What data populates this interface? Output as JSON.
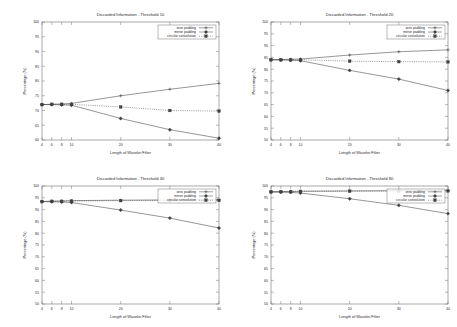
{
  "figure": {
    "layout": "2x2 grid of line charts",
    "shared": {
      "xlabel": "Length of Wavelet Filter",
      "ylabel": "Percentage (%)",
      "xticks": [
        4,
        6,
        8,
        10,
        20,
        30,
        40
      ],
      "xlim": [
        4,
        40
      ],
      "series_names": [
        "zero padding",
        "mirror padding",
        "circular convolution"
      ]
    }
  },
  "chart_data": [
    {
      "type": "line",
      "title": "Discarded Information - Threshold 10",
      "xlabel": "Length of Wavelet Filter",
      "ylabel": "Percentage (%)",
      "xlim": [
        4,
        40
      ],
      "ylim": [
        60,
        100
      ],
      "yticks": [
        60,
        65,
        70,
        75,
        80,
        85,
        90,
        95,
        100
      ],
      "xticks": [
        4,
        6,
        8,
        10,
        20,
        30,
        40
      ],
      "grid": false,
      "legend_position": "top-right",
      "x": [
        4,
        6,
        8,
        10,
        20,
        30,
        40
      ],
      "series": [
        {
          "name": "zero padding",
          "values": [
            72.0,
            72.1,
            72.2,
            72.4,
            75.0,
            77.2,
            79.2
          ]
        },
        {
          "name": "mirror padding",
          "values": [
            72.0,
            72.0,
            71.9,
            71.8,
            67.3,
            63.5,
            60.6
          ]
        },
        {
          "name": "circular convolution",
          "values": [
            72.0,
            72.1,
            72.1,
            72.1,
            71.2,
            70.0,
            69.8
          ]
        }
      ]
    },
    {
      "type": "line",
      "title": "Discarded Information - Threshold 20",
      "xlabel": "Length of Wavelet Filter",
      "ylabel": "Percentage (%)",
      "xlim": [
        4,
        40
      ],
      "ylim": [
        50,
        100
      ],
      "yticks": [
        50,
        55,
        60,
        65,
        70,
        75,
        80,
        85,
        90,
        95,
        100
      ],
      "xticks": [
        4,
        6,
        8,
        10,
        20,
        30,
        40
      ],
      "grid": false,
      "legend_position": "top-right",
      "x": [
        4,
        6,
        8,
        10,
        20,
        30,
        40
      ],
      "series": [
        {
          "name": "zero padding",
          "values": [
            84.0,
            84.1,
            84.2,
            84.3,
            86.0,
            87.4,
            88.2
          ]
        },
        {
          "name": "mirror padding",
          "values": [
            84.0,
            83.9,
            83.8,
            83.6,
            79.5,
            75.8,
            71.0
          ]
        },
        {
          "name": "circular convolution",
          "values": [
            84.0,
            84.0,
            84.0,
            84.0,
            83.4,
            83.2,
            83.1
          ]
        }
      ]
    },
    {
      "type": "line",
      "title": "Discarded Information - Threshold 40",
      "xlabel": "Length of Wavelet Filter",
      "ylabel": "Percentage (%)",
      "xlim": [
        4,
        40
      ],
      "ylim": [
        50,
        100
      ],
      "yticks": [
        50,
        55,
        60,
        65,
        70,
        75,
        80,
        85,
        90,
        95,
        100
      ],
      "xticks": [
        4,
        6,
        8,
        10,
        20,
        30,
        40
      ],
      "grid": false,
      "legend_position": "top-right",
      "x": [
        4,
        6,
        8,
        10,
        20,
        30,
        40
      ],
      "series": [
        {
          "name": "zero padding",
          "values": [
            93.4,
            93.6,
            93.7,
            93.8,
            94.0,
            94.1,
            94.2
          ]
        },
        {
          "name": "mirror padding",
          "values": [
            93.4,
            93.3,
            93.2,
            93.0,
            89.8,
            86.4,
            82.2
          ]
        },
        {
          "name": "circular convolution",
          "values": [
            93.4,
            93.5,
            93.5,
            93.6,
            93.8,
            93.9,
            93.9
          ]
        }
      ]
    },
    {
      "type": "line",
      "title": "Discarded Information - Threshold 80",
      "xlabel": "Length of Wavelet Filter",
      "ylabel": "Percentage (%)",
      "xlim": [
        50,
        100
      ],
      "ylim": [
        50,
        100
      ],
      "yticks": [
        50,
        55,
        60,
        65,
        70,
        75,
        80,
        85,
        90,
        95,
        100
      ],
      "xticks": [
        4,
        6,
        8,
        10,
        20,
        30,
        40
      ],
      "grid": false,
      "legend_position": "top-right",
      "x": [
        4,
        6,
        8,
        10,
        20,
        30,
        40
      ],
      "series": [
        {
          "name": "zero padding",
          "values": [
            97.5,
            97.6,
            97.7,
            97.8,
            97.9,
            98.0,
            98.1
          ]
        },
        {
          "name": "mirror padding",
          "values": [
            97.5,
            97.4,
            97.3,
            97.0,
            94.6,
            91.8,
            88.3
          ]
        },
        {
          "name": "circular convolution",
          "values": [
            97.5,
            97.6,
            97.6,
            97.7,
            97.8,
            97.9,
            97.9
          ]
        }
      ]
    }
  ],
  "colors": {
    "line": "#404040",
    "axis": "#555555",
    "text": "#2a2a2a",
    "background": "#ffffff"
  }
}
